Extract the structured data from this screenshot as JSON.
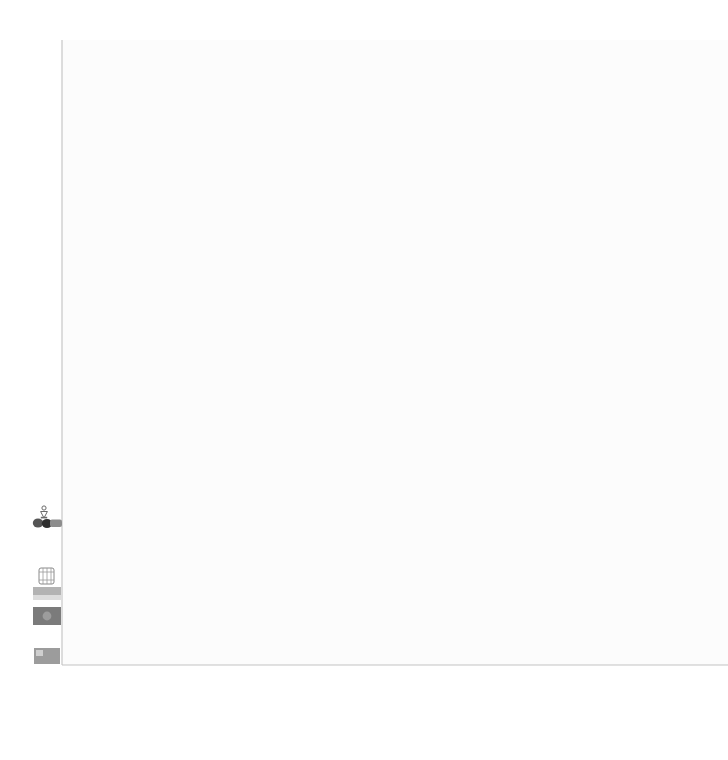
{
  "chart_data": {
    "type": "line",
    "title": "",
    "xlabel": "",
    "ylabel": "",
    "xlim": [
      1963.5,
      2009
    ],
    "ylim": [
      1,
      13400
    ],
    "grid": true,
    "legend": "none",
    "y_ticks": [
      "12,500",
      "10,000",
      "7,500",
      "5,000",
      "2,500",
      "1"
    ],
    "y_tick_values": [
      12500,
      10000,
      7500,
      5000,
      2500,
      1
    ],
    "x_ticks": [
      "1965",
      "1970",
      "1975",
      "1980",
      "1985",
      "1990",
      "1995",
      "2000",
      "2005"
    ],
    "x_tick_values": [
      1965,
      1970,
      1975,
      1980,
      1985,
      1990,
      1995,
      2000,
      2005
    ],
    "series": [
      {
        "name": "upper-envelope-thin",
        "style": "thin-solid",
        "color": "#6f6f6f",
        "x": [
          1965,
          1967,
          1969,
          1971,
          1973,
          1974,
          1976,
          1978,
          1979,
          1980,
          1981,
          1983,
          1985,
          1987,
          1989,
          1991,
          1993,
          1995,
          1997,
          1999,
          2001,
          2003,
          2005,
          2007,
          2008
        ],
        "values": [
          4180,
          4500,
          5050,
          5580,
          6300,
          6180,
          6520,
          7060,
          7000,
          6700,
          6680,
          6700,
          7200,
          7500,
          7850,
          8000,
          8150,
          8400,
          8800,
          9050,
          9350,
          9900,
          10600,
          11200,
          11550
        ]
      },
      {
        "name": "thick-light-grey-wave",
        "style": "thick-solid",
        "color": "#a9a9a9",
        "x": [
          1965,
          1968,
          1971,
          1973,
          1975,
          1977,
          1979,
          1981,
          1983,
          1985,
          1987,
          1989,
          1991,
          1993,
          1995,
          1997,
          1999,
          2001,
          2003,
          2005,
          2007,
          2008
        ],
        "values": [
          2880,
          3350,
          3900,
          4250,
          4420,
          4750,
          5050,
          5120,
          4980,
          5150,
          5400,
          5600,
          5550,
          5600,
          5800,
          5920,
          5900,
          6050,
          6400,
          6750,
          7250,
          7500
        ]
      },
      {
        "name": "straight-grey-trend",
        "style": "medium-solid",
        "color": "#8a8a8a",
        "x": [
          1965,
          2008
        ],
        "values": [
          2620,
          6700
        ]
      },
      {
        "name": "dashed-grey",
        "style": "dashed",
        "color": "#9d9d9d",
        "x": [
          1965,
          1968,
          1971,
          1973,
          1975,
          1977,
          1979,
          1981,
          1983,
          1985,
          1987,
          1989,
          1991,
          1993,
          1995,
          1997,
          1999,
          2001,
          2003,
          2005,
          2007,
          2008
        ],
        "values": [
          1240,
          1620,
          2050,
          2660,
          2620,
          2760,
          3060,
          2830,
          2700,
          2800,
          2930,
          3000,
          3020,
          3080,
          3180,
          3300,
          3400,
          3520,
          3680,
          3900,
          4180,
          4280
        ]
      },
      {
        "name": "black-solid",
        "style": "heavy-black",
        "color": "#111111",
        "x": [
          1965,
          1968,
          1971,
          1973,
          1975,
          1977,
          1979,
          1981,
          1983,
          1985,
          1987,
          1989,
          1991,
          1993,
          1995,
          1997,
          1999,
          2001,
          2003,
          2005,
          2007,
          2008
        ],
        "values": [
          1190,
          1570,
          2000,
          2620,
          2440,
          2560,
          2900,
          2620,
          2520,
          2600,
          2760,
          2830,
          2840,
          2900,
          3000,
          3100,
          3200,
          3320,
          3460,
          3680,
          3960,
          4060
        ]
      },
      {
        "name": "mid-grey-lower",
        "style": "thin-solid",
        "color": "#787878",
        "x": [
          1965,
          1968,
          1971,
          1974,
          1977,
          1980,
          1983,
          1986,
          1989,
          1992,
          1995,
          1998,
          2001,
          2004,
          2007,
          2008
        ],
        "values": [
          1760,
          1880,
          2000,
          1980,
          2060,
          2000,
          1860,
          2000,
          2140,
          2120,
          2180,
          2260,
          2300,
          2350,
          2400,
          2410
        ]
      },
      {
        "name": "low-grey",
        "style": "thin-solid",
        "color": "#8c8c8c",
        "x": [
          1965,
          1968,
          1971,
          1974,
          1977,
          1980,
          1983,
          1986,
          1989,
          1992,
          1995,
          1998,
          2001,
          2004,
          2007,
          2008
        ],
        "values": [
          1480,
          1560,
          1680,
          1680,
          1740,
          1620,
          1560,
          1700,
          1820,
          1800,
          1860,
          1920,
          1960,
          2010,
          2050,
          2060
        ]
      },
      {
        "name": "rising-dark-lower",
        "style": "thin-solid",
        "color": "#4e4e4e",
        "x": [
          1965,
          1970,
          1975,
          1980,
          1985,
          1990,
          1993,
          1996,
          1999,
          2002,
          2005,
          2008
        ],
        "values": [
          1040,
          1060,
          1080,
          1120,
          1180,
          1300,
          1380,
          1460,
          1560,
          1760,
          2000,
          2140
        ]
      },
      {
        "name": "baseline-grey",
        "style": "thin-solid",
        "color": "#9a9a9a",
        "x": [
          1965,
          1968,
          1971,
          1974,
          1977,
          1980,
          1985,
          1990,
          1995,
          2000,
          2005,
          2008
        ],
        "values": [
          1040,
          1060,
          1042,
          1030,
          1045,
          1050,
          1055,
          1060,
          1068,
          1075,
          1082,
          1086
        ]
      }
    ],
    "event_markers": [
      {
        "label": "1972 Limits to Growth",
        "year": 1972,
        "bold": true,
        "label_y": 290,
        "line_top": 300,
        "dot": "circle-open-large"
      },
      {
        "label": "1973 oil crisis",
        "year": 1973.4,
        "bold": true,
        "label_y": 233,
        "line_top": 243,
        "dot": "none"
      },
      {
        "label": "1979 energy crisis",
        "year": 1979.3,
        "bold": true,
        "label_y": 190,
        "line_top": 200,
        "dot": "circle-open-large"
      },
      {
        "label": "1987 Brundtland Report",
        "year": 1987.2,
        "bold": true,
        "label_y": 250,
        "line_top": 260,
        "dot": "none"
      },
      {
        "label": "1990 energy crisis",
        "year": 1990.0,
        "bold": true,
        "label_y": 215,
        "line_top": 225,
        "dot": "circle-open-large"
      },
      {
        "label": "1992 Rio Summit | Agenda 21",
        "year": 1992.1,
        "bold": true,
        "label_y": 243,
        "line_top": 253,
        "dot": "circle-open-large"
      },
      {
        "label": "1997 Kyoto protocol",
        "year": 1997.1,
        "bold": true,
        "label_y": 250,
        "line_top": 260,
        "dot": "circle-open-large"
      },
      {
        "label": "Peak Oil",
        "year": 2005.6,
        "bold": true,
        "label_y": 205,
        "line_top": 215,
        "dot": "circle-open-large"
      }
    ],
    "conflict_markers": [
      {
        "label": "iran crisis",
        "year": 1978.6,
        "start": 1978.4,
        "end": 1979.1
      },
      {
        "label": "iran-iraq war",
        "year": 1983.0,
        "start": 1980.3,
        "end": 1988.4
      },
      {
        "label": "gulf war",
        "year": 1990.6,
        "start": 1990.4,
        "end": 1991.1
      },
      {
        "label": "iraq war",
        "year": 2003.6,
        "start": 2003.2,
        "end": 2008.5
      }
    ],
    "axis_glyphs": [
      {
        "name": "energy-e-glyph",
        "text": "E"
      },
      {
        "name": "person-pictogram-glyph",
        "text": ""
      },
      {
        "name": "oil-barrel-dots-glyph",
        "text": ""
      },
      {
        "name": "barrel-stack-glyph",
        "text": ""
      },
      {
        "name": "grey-swatch-glyph",
        "text": ""
      },
      {
        "name": "dark-swatch-glyph",
        "text": ""
      },
      {
        "name": "bottom-swatch-glyph",
        "text": ""
      }
    ],
    "footer_thumbnails": [
      {
        "name": "drilling-rig-thumb"
      },
      {
        "name": "pipeline-thumb"
      },
      {
        "name": "hands-thumb"
      },
      {
        "name": "screen-display-thumb"
      },
      {
        "name": "truck-thumb"
      },
      {
        "name": "van-thumb"
      },
      {
        "name": "car-thumb"
      },
      {
        "name": "papers-thumb"
      },
      {
        "name": "grey-panel-thumb"
      },
      {
        "name": "flag-panel-thumb"
      },
      {
        "name": "city-skyline-thumb"
      }
    ]
  }
}
